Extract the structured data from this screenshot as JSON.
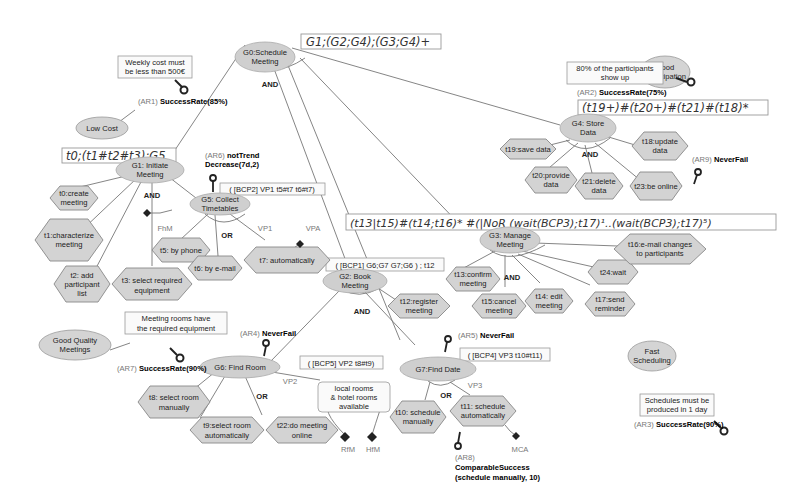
{
  "diagram": {
    "expressions": {
      "g0": "G1;(G2;G4);(G3;G4)+",
      "g1": "t0;(t1#t2#t3);G5",
      "g4": "(t19+)#(t20+)#(t21)#(t18)*",
      "g3": "(t13|t15)#(t14;t16)* #(|NoR (wait(BCP3);t17)¹..(wait(BCP3);t17)⁵)",
      "g5": "( [BCP2] VP1 t5#t7 t6#t7)",
      "g2": "( [BCP1] G6;G7 G7;G6 ) ; t12",
      "g6": "( [BCP5] VP2 t8#t9)",
      "g7": "( [BCP4] VP3 t10#t11)"
    },
    "goals": {
      "g0": [
        "G0:Schedule",
        "Meeting"
      ],
      "g1": [
        "G1: Initiate",
        "Meeting"
      ],
      "g5": [
        "G5: Collect",
        "Timetables"
      ],
      "g2": [
        "G2: Book",
        "Meeting"
      ],
      "g3": [
        "G3: Manage",
        "Meeting"
      ],
      "g4": [
        "G4: Store",
        "Data"
      ],
      "g6": [
        "G6: Find Room"
      ],
      "g7": [
        "G7:Find Date"
      ]
    },
    "tasks": {
      "t0": [
        "t0:create",
        "meeting"
      ],
      "t1": [
        "t1:characterize",
        "meeting"
      ],
      "t2": [
        "t2: add",
        "participant",
        "list"
      ],
      "t3": [
        "t3: select required",
        "equipment"
      ],
      "t5": [
        "t5: by phone"
      ],
      "t6": [
        "t6: by e-mail"
      ],
      "t7": [
        "t7: automatically"
      ],
      "t8": [
        "t8: select room",
        "manually"
      ],
      "t9": [
        "t9:select room",
        "automatically"
      ],
      "t22": [
        "t22:do meeting",
        "online"
      ],
      "t10": [
        "t10: schedule",
        "manually"
      ],
      "t11": [
        "t11: schedule",
        "automatically"
      ],
      "t12": [
        "t12:register",
        "meeting"
      ],
      "t13": [
        "t13:confirm",
        "meeting"
      ],
      "t14": [
        "t14: edit",
        "meeting"
      ],
      "t15": [
        "t15:cancel",
        "meeting"
      ],
      "t16": [
        "t16:e-mail changes",
        "to participants"
      ],
      "t17": [
        "t17:send",
        "reminder"
      ],
      "t24": [
        "t24:wait"
      ],
      "t18": [
        "t18:update",
        "data"
      ],
      "t19": [
        "t19:save data"
      ],
      "t20": [
        "t20:provide",
        "data"
      ],
      "t21": [
        "t21:delete",
        "data"
      ],
      "t23": [
        "t23:be online"
      ]
    },
    "decompositions": {
      "g0": "AND",
      "g1": "AND",
      "g5": "OR",
      "g2": "AND",
      "g3": "AND",
      "g4": "AND",
      "g6": "OR",
      "g7": "OR"
    },
    "softgoals": {
      "low_cost": [
        "Low Cost"
      ],
      "good_participation": [
        "Good",
        "Participation"
      ],
      "good_quality": [
        "Good Quality",
        "Meetings"
      ],
      "fast_scheduling": [
        "Fast",
        "Scheduling"
      ]
    },
    "quality_constraints": {
      "low_cost": [
        "Weekly cost must",
        "be less than 500€"
      ],
      "good_participation": [
        "80% of the participants",
        "show up"
      ],
      "good_quality": [
        "Meeting rooms have",
        "the required equipment"
      ],
      "fast_scheduling": [
        "Schedules must be",
        "produced in 1 day"
      ]
    },
    "awreqs": {
      "ar1": {
        "id": "(AR1)",
        "text": "SuccessRate(85%)"
      },
      "ar2": {
        "id": "(AR2)",
        "text": "SuccessRate(75%)"
      },
      "ar3": {
        "id": "(AR3)",
        "text": "SuccessRate(90%)"
      },
      "ar4": {
        "id": "(AR4)",
        "text": "NeverFail"
      },
      "ar5": {
        "id": "(AR5)",
        "text": "NeverFail"
      },
      "ar6": {
        "id": "(AR6)",
        "text": [
          "notTrend",
          "Decrease(7d,2)"
        ]
      },
      "ar7": {
        "id": "(AR7)",
        "text": "SuccessRate(90%)"
      },
      "ar8": {
        "id": "(AR8)",
        "text": [
          "ComparableSuccess",
          "(schedule manually, 10)"
        ]
      },
      "ar9": {
        "id": "(AR9)",
        "text": "NeverFail"
      }
    },
    "variation_points": {
      "vp1": "VP1",
      "vp2": "VP2",
      "vp3": "VP3",
      "vpa": "VPA"
    },
    "context": {
      "fhm": "FhM",
      "rfm": "RfM",
      "hfm": "HfM",
      "mca": "MCA",
      "rooms_note": [
        "local rooms",
        "& hotel rooms",
        "available"
      ]
    }
  }
}
